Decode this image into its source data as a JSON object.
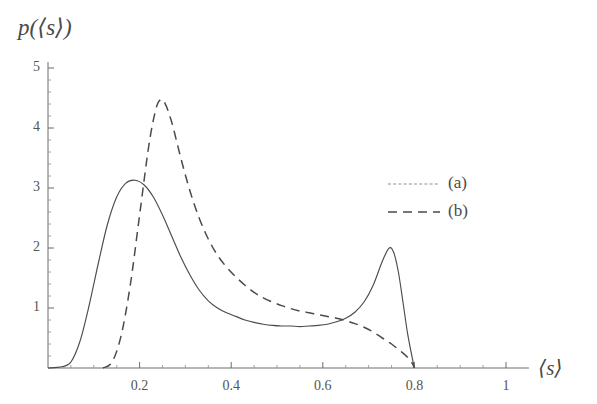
{
  "chart_data": {
    "type": "line",
    "title": "",
    "xlabel": "⟨s⟩",
    "ylabel": "p(⟨s⟩)",
    "xlim": [
      0,
      1.05
    ],
    "ylim": [
      0,
      5.1
    ],
    "grid": false,
    "legend_position": "upper-right-inside",
    "x_ticks_major": [
      0.2,
      0.4,
      0.6,
      0.8,
      1
    ],
    "x_tick_labels": [
      "0.2",
      "0.4",
      "0.6",
      "0.8",
      "1"
    ],
    "x_minor_step": 0.05,
    "y_ticks_major": [
      1,
      2,
      3,
      4,
      5
    ],
    "y_tick_labels": [
      "1",
      "2",
      "3",
      "4",
      "5"
    ],
    "y_minor_step": 0.2,
    "series": [
      {
        "name": "(a)",
        "style": "solid",
        "color": "#4c4c4c",
        "x": [
          0.0,
          0.03,
          0.05,
          0.07,
          0.09,
          0.11,
          0.13,
          0.15,
          0.17,
          0.19,
          0.21,
          0.23,
          0.25,
          0.27,
          0.29,
          0.31,
          0.33,
          0.35,
          0.37,
          0.39,
          0.41,
          0.43,
          0.45,
          0.47,
          0.49,
          0.51,
          0.53,
          0.55,
          0.57,
          0.59,
          0.61,
          0.63,
          0.65,
          0.67,
          0.69,
          0.71,
          0.73,
          0.745,
          0.755,
          0.765,
          0.775,
          0.785,
          0.795,
          0.8
        ],
        "y": [
          0.0,
          0.02,
          0.1,
          0.45,
          1.05,
          1.75,
          2.4,
          2.85,
          3.08,
          3.13,
          3.05,
          2.85,
          2.55,
          2.2,
          1.85,
          1.55,
          1.3,
          1.12,
          1.0,
          0.92,
          0.86,
          0.8,
          0.76,
          0.73,
          0.71,
          0.7,
          0.7,
          0.69,
          0.7,
          0.71,
          0.73,
          0.77,
          0.83,
          0.93,
          1.1,
          1.38,
          1.78,
          2.0,
          1.92,
          1.6,
          1.1,
          0.58,
          0.18,
          0.0
        ]
      },
      {
        "name": "(b)",
        "style": "dashed",
        "color": "#4a4a4a",
        "x": [
          0.12,
          0.14,
          0.16,
          0.18,
          0.2,
          0.22,
          0.235,
          0.245,
          0.255,
          0.27,
          0.29,
          0.31,
          0.33,
          0.35,
          0.37,
          0.39,
          0.41,
          0.43,
          0.45,
          0.47,
          0.49,
          0.51,
          0.53,
          0.55,
          0.57,
          0.59,
          0.61,
          0.63,
          0.65,
          0.67,
          0.69,
          0.71,
          0.73,
          0.75,
          0.77,
          0.785,
          0.795,
          0.8
        ],
        "y": [
          0.0,
          0.1,
          0.55,
          1.4,
          2.55,
          3.7,
          4.3,
          4.47,
          4.42,
          4.1,
          3.5,
          2.95,
          2.5,
          2.15,
          1.88,
          1.68,
          1.52,
          1.38,
          1.26,
          1.17,
          1.1,
          1.04,
          0.99,
          0.95,
          0.92,
          0.89,
          0.86,
          0.83,
          0.79,
          0.74,
          0.68,
          0.6,
          0.5,
          0.4,
          0.28,
          0.18,
          0.08,
          0.0
        ]
      }
    ]
  },
  "legend": {
    "entries": [
      {
        "label": "(a)"
      },
      {
        "label": "(b)"
      }
    ]
  },
  "axis_labels": {
    "y": "p(⟨s⟩)",
    "x": "⟨s⟩"
  }
}
